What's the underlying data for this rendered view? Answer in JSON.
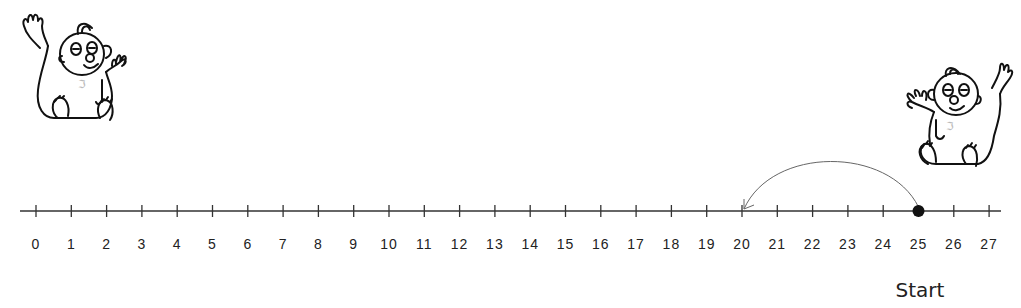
{
  "number_line": {
    "min": 0,
    "max": 27,
    "labels": [
      "0",
      "1",
      "2",
      "3",
      "4",
      "5",
      "6",
      "7",
      "8",
      "9",
      "10",
      "11",
      "12",
      "13",
      "14",
      "15",
      "16",
      "17",
      "18",
      "19",
      "20",
      "21",
      "22",
      "23",
      "24",
      "25",
      "26",
      "27"
    ],
    "start_value": 25,
    "jump_to_value": 20,
    "jump_size": -5,
    "line_color": "#333333",
    "arc_color": "#555555",
    "dot_color": "#111111"
  },
  "labels": {
    "start": "Start"
  },
  "illustrations": {
    "left": "baby-waving-icon",
    "right": "baby-waving-icon"
  }
}
